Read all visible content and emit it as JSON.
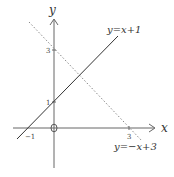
{
  "diagram": {
    "axes": {
      "x_label": "x",
      "y_label": "y",
      "origin_label": "O"
    },
    "ticks": {
      "x_neg1": "−1",
      "x_3": "3",
      "y_1": "1",
      "y_3": "3"
    },
    "lines": [
      {
        "equation": "y=x+1",
        "style": "solid",
        "color": "#333333"
      },
      {
        "equation": "y=−x+3",
        "style": "dotted",
        "color": "#888888"
      }
    ],
    "scale": {
      "origin_px": [
        54,
        128
      ],
      "unit_px": 25.5
    }
  }
}
